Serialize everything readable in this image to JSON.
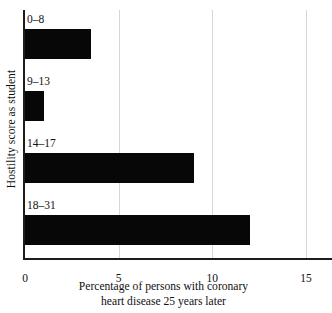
{
  "chart_data": {
    "type": "bar",
    "orientation": "horizontal",
    "title": "",
    "categories": [
      "0–8",
      "9–13",
      "14–17",
      "18–31"
    ],
    "values": [
      3.5,
      1.0,
      9.0,
      12.0
    ],
    "xlabel_line1": "Percentage of persons with coronary",
    "xlabel_line2": "heart disease 25 years later",
    "ylabel": "Hostility score as student",
    "xlim": [
      0,
      15
    ],
    "xticks": [
      "0",
      "5",
      "10",
      "15"
    ],
    "xtick_values": [
      0,
      5,
      10,
      15
    ],
    "grid": "vertical gridlines at 5, 10, 15",
    "legend": "none",
    "bar_color": "#070707",
    "grid_color": "#d6d6d6",
    "axis_color": "#1c1c1c",
    "background_color": "#ffffff"
  }
}
